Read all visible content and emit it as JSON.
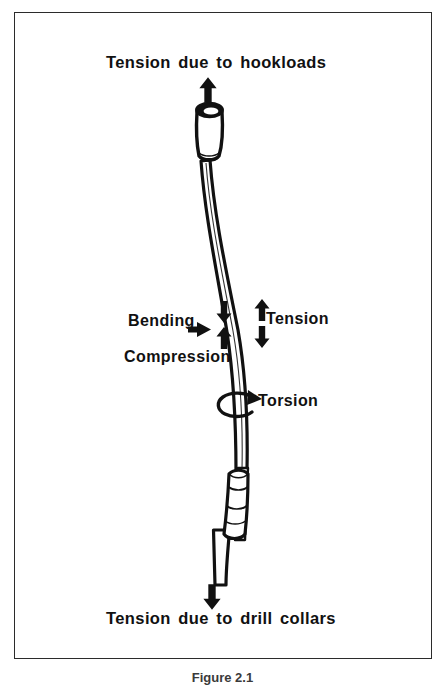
{
  "figure": {
    "caption": "Figure 2.1",
    "frame_color": "#2b2b2b",
    "background_color": "#ffffff",
    "ink_color": "#111111"
  },
  "labels": {
    "top_force": "Tension due to hookloads",
    "bottom_force": "Tension due to drill collars",
    "bending": "Bending",
    "compression": "Compression",
    "tension": "Tension",
    "torsion": "Torsion"
  },
  "annotations": [
    {
      "name": "hookload-arrow",
      "direction": "up",
      "meaning": "Tension due to hookloads"
    },
    {
      "name": "compression-arrow-down",
      "direction": "down",
      "meaning": "Compression side upper"
    },
    {
      "name": "compression-arrow-up",
      "direction": "up",
      "meaning": "Compression side lower"
    },
    {
      "name": "tension-arrow-up",
      "direction": "up",
      "meaning": "Tension side upper"
    },
    {
      "name": "tension-arrow-down",
      "direction": "down",
      "meaning": "Tension side lower"
    },
    {
      "name": "bending-arrow",
      "direction": "right",
      "meaning": "Bending load pointer"
    },
    {
      "name": "torsion-arrow",
      "direction": "rotational",
      "meaning": "Torsion about pipe axis"
    },
    {
      "name": "drill-collar-arrow",
      "direction": "down",
      "meaning": "Tension due to drill collars"
    }
  ],
  "drill_string": {
    "parts": [
      {
        "name": "upper-tool-joint",
        "description": "Upper tool joint with open bore"
      },
      {
        "name": "upper-pipe-body",
        "description": "Curved drill pipe body, upper section"
      },
      {
        "name": "lower-tool-joint",
        "description": "Lower tool joint coupling"
      },
      {
        "name": "lower-pipe-body",
        "description": "Drill pipe body, lower section"
      }
    ]
  }
}
